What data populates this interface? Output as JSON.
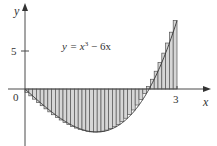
{
  "chart_data": {
    "type": "bar",
    "subtype": "riemann-sum-right-endpoints",
    "title": "",
    "function_label": "y = x³ − 6x",
    "function": "x^3 - 6x",
    "xlabel": "x",
    "ylabel": "y",
    "xlim": [
      0,
      3
    ],
    "ylim": [
      -6,
      9
    ],
    "x_ticks": [
      {
        "value": 0,
        "label": "0"
      },
      {
        "value": 3,
        "label": "3"
      }
    ],
    "y_ticks": [
      {
        "value": 5,
        "label": "5"
      }
    ],
    "grid": false,
    "legend": "none",
    "n_rectangles": 40,
    "delta_x": 0.075,
    "sample_point": "right endpoint",
    "x": [
      0.075,
      0.15,
      0.225,
      0.3,
      0.375,
      0.45,
      0.525,
      0.6,
      0.675,
      0.75,
      0.825,
      0.9,
      0.975,
      1.05,
      1.125,
      1.2,
      1.275,
      1.35,
      1.425,
      1.5,
      1.575,
      1.65,
      1.725,
      1.8,
      1.875,
      1.95,
      2.025,
      2.1,
      2.175,
      2.25,
      2.325,
      2.4,
      2.475,
      2.55,
      2.625,
      2.7,
      2.775,
      2.85,
      2.925,
      3.0
    ],
    "values": [
      -0.45,
      -0.897,
      -1.339,
      -1.773,
      -2.197,
      -2.609,
      -3.005,
      -3.384,
      -3.742,
      -4.078,
      -4.388,
      -4.671,
      -4.923,
      -5.142,
      -5.326,
      -5.472,
      -5.577,
      -5.64,
      -5.656,
      -5.625,
      -5.543,
      -5.408,
      -5.217,
      -4.968,
      -4.658,
      -4.285,
      -3.846,
      -3.339,
      -2.761,
      -2.109,
      -1.382,
      -0.576,
      0.311,
      1.283,
      2.338,
      3.483,
      4.72,
      6.049,
      7.475,
      9.0
    ]
  },
  "axes": {
    "x_label": "x",
    "y_label": "y",
    "origin_label": "0",
    "x_tick_label": "3",
    "y_tick_label": "5"
  },
  "annotation": {
    "equation_prefix": "y = x",
    "equation_exp": "3",
    "equation_suffix": " − 6x"
  }
}
